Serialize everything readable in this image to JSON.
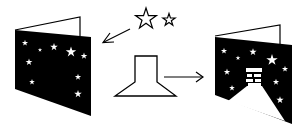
{
  "figure": {
    "type": "craft-instruction-diagram",
    "background_color": "#ffffff",
    "ink_color": "#000000",
    "steps": [
      {
        "name": "star-card",
        "description": "Folded card with black front panel and white star cut-outs"
      },
      {
        "name": "star-stencils",
        "description": "Two outlined star shapes (large and small) with arrow pointing to the star card"
      },
      {
        "name": "lamp-stencil",
        "description": "Outlined lamp / chimney-shaped template with arrow pointing to the result card"
      },
      {
        "name": "result-card",
        "description": "Folded card with black front panel, stars, chimney and white light beam cut-out"
      }
    ],
    "arrows": [
      {
        "from": "star-stencils",
        "to": "star-card"
      },
      {
        "from": "lamp-stencil",
        "to": "result-card"
      }
    ]
  }
}
